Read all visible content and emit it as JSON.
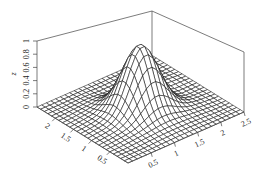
{
  "chart_data": {
    "type": "surface",
    "title": "",
    "xlabel": "",
    "ylabel": "",
    "zlabel": "z",
    "x_ticks": [
      "0.5",
      "1",
      "1.5",
      "2",
      "2.5"
    ],
    "y_ticks": [
      "0.5",
      "1",
      "1.5",
      "2"
    ],
    "z_ticks": [
      "0",
      "0.2",
      "0.4",
      "0.6",
      "0.8",
      "1"
    ],
    "x_range": [
      0,
      2.5
    ],
    "y_range": [
      0,
      2.5
    ],
    "z_range": [
      0,
      1
    ],
    "peak": {
      "x": 1.25,
      "y": 1.25,
      "z": 0.95
    },
    "grid": false,
    "box": true,
    "mesh_resolution": 25
  },
  "labels": {
    "z_title": "z",
    "z_ticks": [
      "0",
      "0.2",
      "0.4",
      "0.6",
      "0.8",
      "1"
    ],
    "x_ticks": [
      "0.5",
      "1",
      "1.5",
      "2",
      "2.5"
    ],
    "y_ticks": [
      "0.5",
      "1",
      "1.5",
      "2"
    ]
  }
}
